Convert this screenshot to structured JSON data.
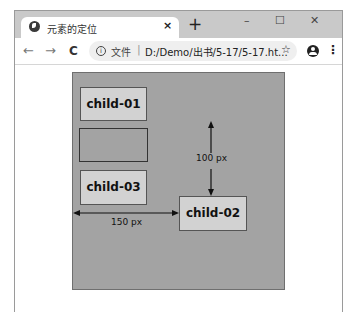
{
  "browser": {
    "tab": {
      "favicon": "globe-icon",
      "title": "元素的定位",
      "close_glyph": "×"
    },
    "new_tab_glyph": "+",
    "window_controls": {
      "minimize": "–",
      "maximize": "☐",
      "close": "✕"
    },
    "toolbar": {
      "back_glyph": "←",
      "forward_glyph": "→",
      "reload_glyph": "C",
      "address": {
        "security_icon": "info-icon",
        "security_label": "文件",
        "separator": "|",
        "url": "D:/Demo/出书/5-17/5-17.ht..."
      },
      "bookmark_glyph": "☆",
      "profile_icon": "account-icon",
      "menu_glyph": "⋮"
    }
  },
  "page": {
    "parent_color": "#a3a3a3",
    "child_color": "#d2d2d2",
    "children": [
      {
        "label": "child-01"
      },
      {
        "label": "child-02"
      },
      {
        "label": "child-03"
      }
    ],
    "dimensions": {
      "horizontal_offset": "150 px",
      "vertical_offset": "100 px"
    }
  }
}
